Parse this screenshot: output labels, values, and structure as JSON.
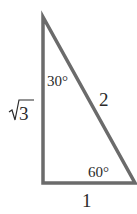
{
  "diagram": {
    "type": "right-triangle",
    "stroke_color": "#6b6b6b",
    "vertices": {
      "top": [
        43,
        17
      ],
      "bottom_left": [
        43,
        183
      ],
      "bottom_right": [
        135,
        183
      ]
    },
    "labels": {
      "left_side": "3",
      "left_side_prefix": "√",
      "hypotenuse": "2",
      "bottom_side": "1",
      "top_angle": "30°",
      "bottom_right_angle": "60°"
    }
  }
}
